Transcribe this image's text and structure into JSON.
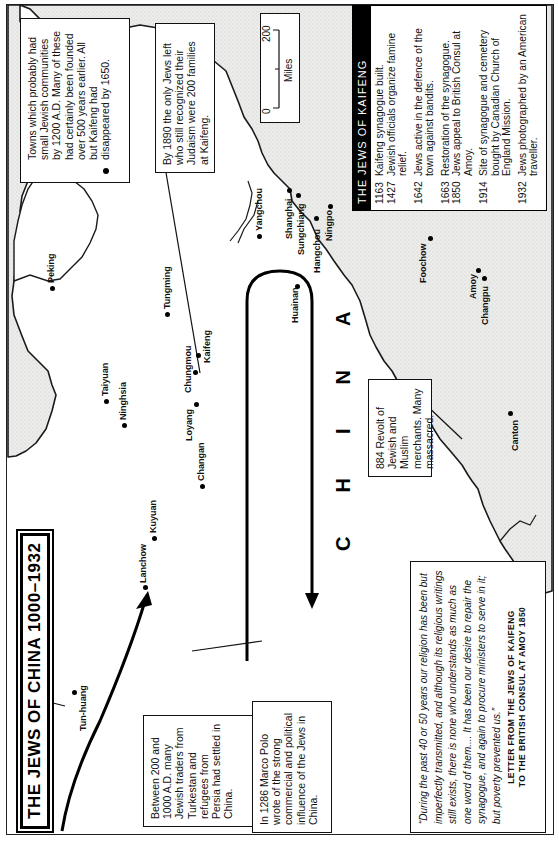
{
  "map": {
    "title": "THE JEWS OF CHINA 1000–1932",
    "country_label": "CHINA",
    "colors": {
      "sea": "#e9e9e7",
      "land": "#ffffff",
      "ink": "#111111",
      "kaifeng_panel_header": "#000000"
    },
    "legend": {
      "symbol": "dot-icon",
      "text": "Towns which probably had small Jewish communities by 1200 A.D. Many of these had certainly been founded over 500 years earlier. All but Kaifeng had disappeared by 1650."
    },
    "scale_bar": {
      "start": "0",
      "end": "200",
      "unit": "Miles"
    },
    "notes": {
      "note_1890": "By 1890 the only Jews left who still recognized their Judaism were 200 families at Kaifeng.",
      "note_200_1000": "Between 200 and 1000 A.D. many Jewish traders from Turkestan and refugees from Persia had settled in China.",
      "note_1286": "In 1286 Marco Polo wrote of the strong commercial and political influence of the Jews in China.",
      "note_884": "884  Revolt of Jewish and Muslim merchants. Many massacred."
    },
    "kaifeng_panel": {
      "heading": "THE JEWS OF KAIFENG",
      "events": [
        {
          "year": "1163",
          "text": "Kaifeng synagogue built."
        },
        {
          "year": "1427",
          "text": "Jewish officials organize famine relief."
        },
        {
          "year": "1642",
          "text": "Jews active in the defence of the town against bandits."
        },
        {
          "year": "1663",
          "text": "Restoration of the synagogue."
        },
        {
          "year": "1850",
          "text": "Jews appeal to British Consul at Amoy."
        },
        {
          "year": "1914",
          "text": "Site of synagogue and cemetery bought by Canadian Church of England Mission."
        },
        {
          "year": "1932",
          "text": "Jews photographed by an American traveller."
        }
      ]
    },
    "quote": {
      "text": "“During the past 40 or 50 years our religion has been but imperfectly transmitted, and although its religious writings still exists, there is none who understands as much as one word of them.... It has been our desire to repair the synagogue, and again to procure ministers to serve in it; but poverty prevented us.”",
      "source_line_1": "LETTER FROM THE JEWS OF KAIFENG",
      "source_line_2": "TO THE BRITISH CONSUL AT AMOY 1850"
    },
    "cities": [
      {
        "name": "Tun-huang"
      },
      {
        "name": "Lanchow"
      },
      {
        "name": "Kuyuan"
      },
      {
        "name": "Ninghsia"
      },
      {
        "name": "Taiyuan"
      },
      {
        "name": "Peking"
      },
      {
        "name": "Changan"
      },
      {
        "name": "Loyang"
      },
      {
        "name": "Chungmou"
      },
      {
        "name": "Kaifeng"
      },
      {
        "name": "Tungming"
      },
      {
        "name": "Huainan"
      },
      {
        "name": "Yangchou"
      },
      {
        "name": "Shanghai"
      },
      {
        "name": "Sungchiang"
      },
      {
        "name": "Hangchou"
      },
      {
        "name": "Ningpo"
      },
      {
        "name": "Foochow"
      },
      {
        "name": "Amoy"
      },
      {
        "name": "Changpu"
      },
      {
        "name": "Canton"
      }
    ]
  }
}
